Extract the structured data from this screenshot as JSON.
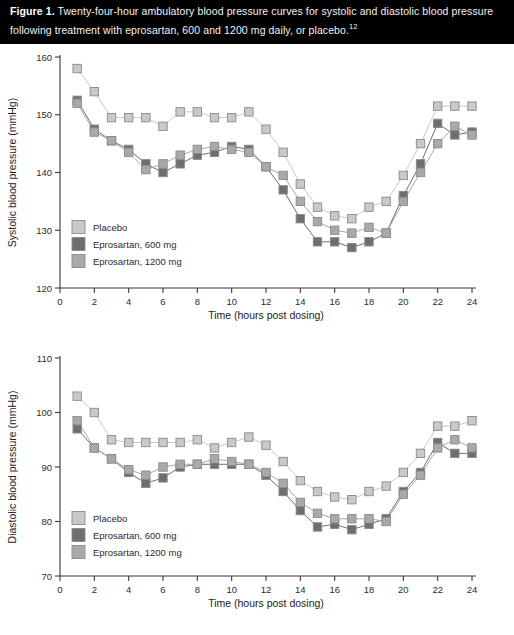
{
  "caption": {
    "figure_label": "Figure 1.",
    "text": " Twenty-four-hour ambulatory blood pressure curves for systolic and diastolic blood pressure following treatment with eprosartan, 600 and 1200 mg daily, or placebo.",
    "reference_superscript": "12"
  },
  "colors": {
    "placebo": "#c9c9c9",
    "eprosartan_600": "#6e6e6e",
    "eprosartan_1200": "#a9a9a9",
    "marker_edge": "#8a8a8a",
    "axis": "#3a3a3a",
    "text": "#1c1c1c",
    "caption_bg": "#000000",
    "caption_fg": "#f2f2f2"
  },
  "legend": {
    "items": [
      {
        "label": "Placebo",
        "color_key": "placebo"
      },
      {
        "label": "Eprosartan, 600 mg",
        "color_key": "eprosartan_600"
      },
      {
        "label": "Eprosartan, 1200 mg",
        "color_key": "eprosartan_1200"
      }
    ]
  },
  "chart_data": [
    {
      "id": "systolic",
      "type": "line",
      "title": "",
      "xlabel": "Time (hours post dosing)",
      "ylabel": "Systolic blood pressure (mmHg)",
      "xlim": [
        0,
        24
      ],
      "ylim": [
        120,
        160
      ],
      "xticks": [
        0,
        2,
        4,
        6,
        8,
        10,
        12,
        14,
        16,
        18,
        20,
        22,
        24
      ],
      "yticks": [
        120,
        130,
        140,
        150,
        160
      ],
      "grid": false,
      "legend_position": "inside-lower-left",
      "x": [
        1,
        2,
        3,
        4,
        5,
        6,
        7,
        8,
        9,
        10,
        11,
        12,
        13,
        14,
        15,
        16,
        17,
        18,
        19,
        20,
        21,
        22,
        23,
        24
      ],
      "series": [
        {
          "name": "Placebo",
          "color_key": "placebo",
          "values": [
            158.0,
            154.0,
            149.5,
            149.5,
            149.5,
            148.0,
            150.5,
            150.5,
            149.5,
            149.5,
            150.5,
            147.5,
            143.5,
            138.0,
            134.0,
            132.5,
            132.0,
            134.0,
            135.0,
            139.5,
            145.0,
            151.5,
            151.5,
            151.5
          ]
        },
        {
          "name": "Eprosartan, 600 mg",
          "color_key": "eprosartan_600",
          "values": [
            152.5,
            147.5,
            145.5,
            144.0,
            141.5,
            140.0,
            141.5,
            143.0,
            143.5,
            144.5,
            144.0,
            141.0,
            137.0,
            132.0,
            128.0,
            128.0,
            127.0,
            128.0,
            129.5,
            136.0,
            141.5,
            148.5,
            146.5,
            147.0
          ]
        },
        {
          "name": "Eprosartan, 1200 mg",
          "color_key": "eprosartan_1200",
          "values": [
            152.0,
            147.0,
            145.5,
            143.5,
            140.5,
            141.5,
            143.0,
            144.0,
            144.5,
            144.0,
            143.5,
            141.0,
            139.5,
            135.0,
            131.5,
            130.0,
            129.5,
            130.5,
            129.5,
            135.0,
            140.0,
            145.0,
            148.0,
            146.5
          ]
        }
      ]
    },
    {
      "id": "diastolic",
      "type": "line",
      "title": "",
      "xlabel": "Time (hours post dosing)",
      "ylabel": "Diastolic blood pressure (mmHg)",
      "xlim": [
        0,
        24
      ],
      "ylim": [
        70,
        110
      ],
      "xticks": [
        0,
        2,
        4,
        6,
        8,
        10,
        12,
        14,
        16,
        18,
        20,
        22,
        24
      ],
      "yticks": [
        70,
        80,
        90,
        100,
        110
      ],
      "grid": false,
      "legend_position": "inside-lower-left",
      "x": [
        1,
        2,
        3,
        4,
        5,
        6,
        7,
        8,
        9,
        10,
        11,
        12,
        13,
        14,
        15,
        16,
        17,
        18,
        19,
        20,
        21,
        22,
        23,
        24
      ],
      "series": [
        {
          "name": "Placebo",
          "color_key": "placebo",
          "values": [
            103.0,
            100.0,
            95.0,
            94.5,
            94.5,
            94.5,
            94.5,
            95.0,
            93.5,
            94.5,
            95.5,
            94.0,
            91.0,
            87.5,
            85.5,
            84.5,
            84.0,
            85.5,
            86.5,
            89.0,
            92.5,
            97.5,
            97.5,
            98.5
          ]
        },
        {
          "name": "Eprosartan, 600 mg",
          "color_key": "eprosartan_600",
          "values": [
            97.0,
            93.5,
            91.5,
            89.0,
            87.0,
            88.0,
            90.0,
            90.5,
            90.5,
            90.5,
            90.5,
            88.5,
            85.5,
            82.0,
            79.0,
            79.5,
            78.5,
            79.5,
            80.5,
            85.5,
            89.0,
            94.5,
            92.5,
            92.5
          ]
        },
        {
          "name": "Eprosartan, 1200 mg",
          "color_key": "eprosartan_1200",
          "values": [
            98.5,
            93.5,
            91.5,
            89.5,
            88.5,
            90.0,
            90.5,
            90.5,
            91.5,
            91.0,
            90.5,
            89.0,
            87.0,
            83.5,
            81.5,
            80.5,
            80.5,
            80.5,
            80.0,
            85.0,
            88.5,
            93.5,
            95.0,
            93.5
          ]
        }
      ]
    }
  ]
}
